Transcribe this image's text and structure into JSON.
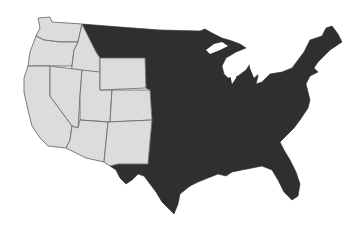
{
  "map": {
    "title": "",
    "subject": "Contiguous United States",
    "colors": {
      "highlighted_region": "#dcdcdc",
      "rest_of_country": "#2f2f2f",
      "state_borders": "#6e6e6e",
      "background": "#ffffff"
    },
    "regions": [
      {
        "name": "Western states (light)",
        "fill": "#dcdcdc",
        "states": [
          "Washington",
          "Oregon",
          "California",
          "Idaho",
          "Nevada",
          "Utah",
          "Arizona",
          "Wyoming",
          "Colorado",
          "New Mexico"
        ]
      },
      {
        "name": "Rest of contiguous US (dark)",
        "fill": "#2f2f2f",
        "states": [
          "Montana",
          "North Dakota",
          "South Dakota",
          "Nebraska",
          "Kansas",
          "Oklahoma",
          "Texas",
          "Minnesota",
          "Iowa",
          "Missouri",
          "Arkansas",
          "Louisiana",
          "Wisconsin",
          "Illinois",
          "Michigan",
          "Indiana",
          "Ohio",
          "Kentucky",
          "Tennessee",
          "Mississippi",
          "Alabama",
          "Georgia",
          "Florida",
          "South Carolina",
          "North Carolina",
          "Virginia",
          "West Virginia",
          "Maryland",
          "Delaware",
          "Pennsylvania",
          "New Jersey",
          "New York",
          "Connecticut",
          "Rhode Island",
          "Massachusetts",
          "Vermont",
          "New Hampshire",
          "Maine"
        ]
      }
    ],
    "state_borders_visible_in": "Western states (light)"
  }
}
